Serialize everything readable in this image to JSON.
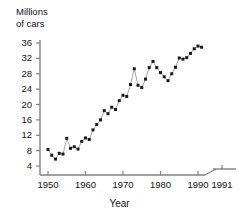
{
  "chart_data": {
    "type": "line",
    "title": "",
    "ylabel": "Millions\nof cars",
    "ylabel_line1": "Millions",
    "ylabel_line2": "of cars",
    "xlabel": "Year",
    "ylim": [
      0,
      36
    ],
    "xlim": [
      1950,
      1991
    ],
    "grid": false,
    "legend": null,
    "ytick_labels": [
      "36",
      "32",
      "28",
      "24",
      "20",
      "16",
      "12",
      "8",
      "4"
    ],
    "ytick_values": [
      36,
      32,
      28,
      24,
      20,
      16,
      12,
      8,
      4
    ],
    "xtick_labels": [
      "1950",
      "1960",
      "1970",
      "1980",
      "1990",
      "1991"
    ],
    "xtick_values": [
      1950,
      1960,
      1970,
      1980,
      1990,
      1991
    ],
    "axis_break": {
      "present": true,
      "between": [
        1990,
        1991
      ]
    },
    "marker": "square",
    "marker_color": "#1a1a1a",
    "line_color": "#9a9a9a",
    "axis_color": "#808080",
    "x": [
      1950,
      1951,
      1952,
      1953,
      1954,
      1955,
      1956,
      1957,
      1958,
      1959,
      1960,
      1961,
      1962,
      1963,
      1964,
      1965,
      1966,
      1967,
      1968,
      1969,
      1970,
      1971,
      1972,
      1973,
      1974,
      1975,
      1976,
      1977,
      1978,
      1979,
      1980,
      1981,
      1982,
      1983,
      1984,
      1985,
      1986,
      1987,
      1988,
      1989,
      1990,
      1991
    ],
    "values": [
      8.3,
      6.8,
      5.8,
      7.3,
      7.1,
      11.2,
      8.6,
      9.0,
      8.4,
      10.4,
      11.3,
      10.9,
      13.4,
      14.8,
      16.0,
      18.4,
      17.6,
      19.3,
      18.7,
      21.0,
      22.4,
      22.1,
      25.2,
      29.3,
      25.0,
      24.4,
      26.6,
      29.6,
      31.2,
      29.6,
      28.3,
      27.2,
      26.2,
      28.0,
      29.7,
      32.1,
      31.8,
      32.2,
      33.3,
      34.5,
      35.2,
      34.9
    ],
    "series_name": "cars"
  },
  "a11y": {
    "figure_name": "millions-of-cars-by-year-line-chart"
  }
}
